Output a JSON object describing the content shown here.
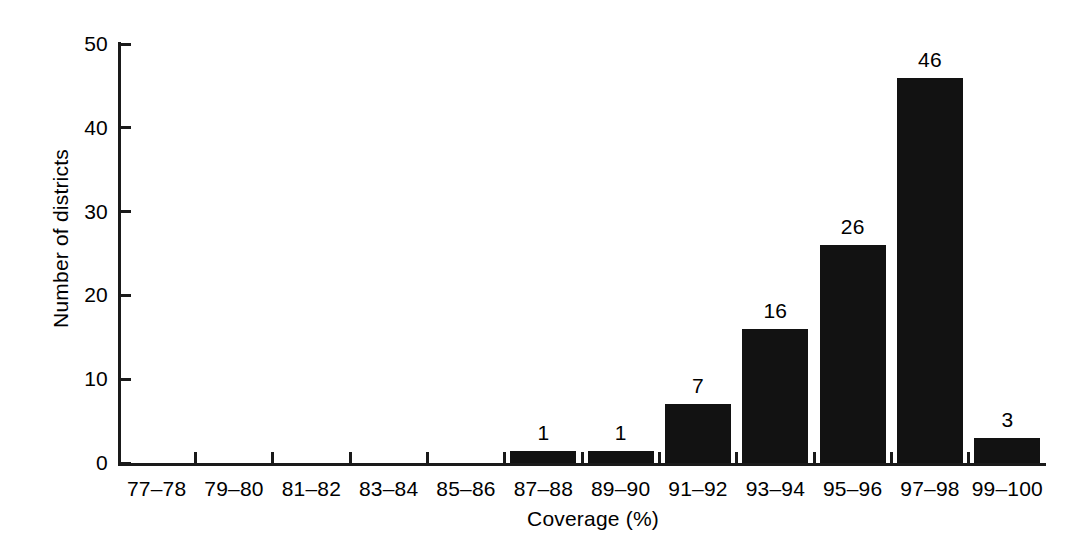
{
  "chart_data": {
    "type": "bar",
    "title": "",
    "subtitle": "",
    "xlabel": "Coverage (%)",
    "ylabel": "Number of districts",
    "categories": [
      "77–78",
      "79–80",
      "81–82",
      "83–84",
      "85–86",
      "87–88",
      "89–90",
      "91–92",
      "93–94",
      "95–96",
      "97–98",
      "99–100"
    ],
    "values": [
      0,
      0,
      0,
      0,
      0,
      1,
      1,
      7,
      16,
      26,
      46,
      3
    ],
    "value_labels": [
      "",
      "",
      "",
      "",
      "",
      "1",
      "1",
      "7",
      "16",
      "26",
      "46",
      "3"
    ],
    "ylim": [
      0,
      50
    ],
    "yticks": [
      0,
      10,
      20,
      30,
      40,
      50
    ],
    "ytick_labels": [
      "0",
      "10",
      "20",
      "30",
      "40",
      "50"
    ],
    "grid": false,
    "legend": false,
    "legend_position": "none",
    "bar_color": "#121212",
    "axis_color": "#1a1a1a",
    "background_color": "#ffffff"
  },
  "axes": {
    "y_title": "Number of districts",
    "x_title": "Coverage (%)"
  }
}
